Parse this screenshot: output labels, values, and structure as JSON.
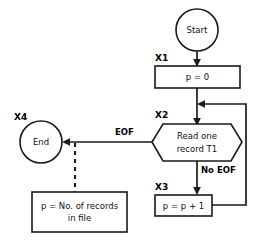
{
  "diagram": {
    "colors": {
      "stroke": "#1a1a1a",
      "fill": "#ffffff",
      "text": "#111111"
    },
    "nodes": {
      "start": {
        "step": "",
        "label": "Start",
        "shape": "circle"
      },
      "init": {
        "step": "X1",
        "label": "p = 0",
        "shape": "rectangle"
      },
      "read": {
        "step": "X2",
        "label_line1": "Read one",
        "label_line2": "record T1",
        "shape": "hexagon"
      },
      "increment": {
        "step": "X3",
        "label": "p = p + 1",
        "shape": "rectangle"
      },
      "end": {
        "step": "X4",
        "label": "End",
        "shape": "circle"
      },
      "annotation": {
        "label_line1": "p = No. of records",
        "label_line2": "in file",
        "shape": "rectangle"
      }
    },
    "edge_labels": {
      "eof": "EOF",
      "no_eof": "No EOF"
    }
  }
}
